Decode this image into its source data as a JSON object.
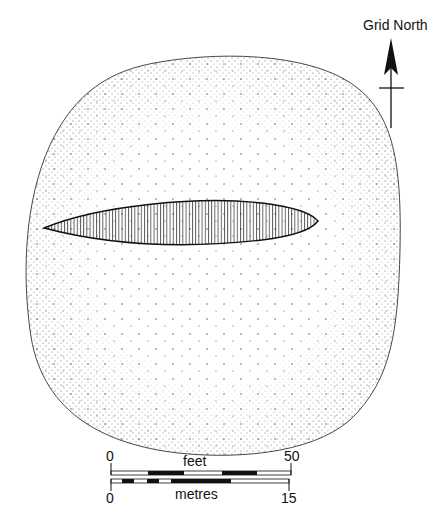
{
  "north_arrow": {
    "label": "Grid North",
    "icon": "north-arrow-icon"
  },
  "plan": {
    "outer_outline": "stippled-mound",
    "inner_feature": "hatched-lens"
  },
  "scale": {
    "feet": {
      "unit_label": "feet",
      "min_label": "0",
      "max_label": "50"
    },
    "metres": {
      "unit_label": "metres",
      "min_label": "0",
      "max_label": "15"
    }
  },
  "colors": {
    "ink": "#111111",
    "background": "#ffffff",
    "stipple": "#444444"
  }
}
